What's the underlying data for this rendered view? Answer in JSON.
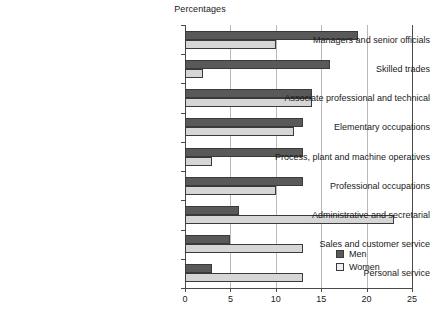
{
  "chart_data": {
    "type": "bar",
    "orientation": "horizontal",
    "title": "Percentages",
    "xlabel": "",
    "ylabel": "",
    "xlim": [
      0,
      25
    ],
    "xticks": [
      0,
      5,
      10,
      15,
      20,
      25
    ],
    "xtick_labels": [
      "0",
      "5",
      "10",
      "15",
      "20",
      "25"
    ],
    "grid": true,
    "legend_position": "bottom-right",
    "categories": [
      "Managers and senior officials",
      "Skilled trades",
      "Associate professional and technical",
      "Elementary occupations",
      "Process, plant and machine operatives",
      "Professional occupations",
      "Administrative and secretarial",
      "Sales and customer service",
      "Personal service"
    ],
    "series": [
      {
        "name": "Men",
        "color": "#595959",
        "values": [
          19,
          16,
          14,
          13,
          13,
          13,
          6,
          5,
          3
        ]
      },
      {
        "name": "Women",
        "color": "#d6d6d6",
        "values": [
          10,
          2,
          14,
          12,
          3,
          10,
          23,
          13,
          13
        ]
      }
    ]
  },
  "legend": {
    "items": [
      {
        "label": "Men"
      },
      {
        "label": "Women"
      }
    ]
  }
}
